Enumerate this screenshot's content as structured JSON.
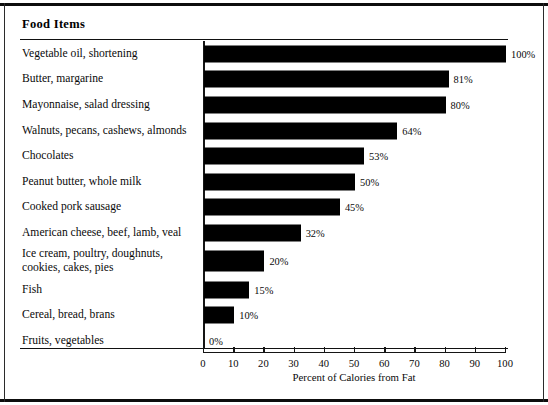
{
  "header": {
    "column_title": "Food  Items"
  },
  "chart_data": {
    "type": "bar",
    "orientation": "horizontal",
    "title": "",
    "xlabel": "Percent of Calories from Fat",
    "ylabel": "Food  Items",
    "xlim": [
      0,
      100
    ],
    "xticks": [
      0,
      10,
      20,
      30,
      40,
      50,
      60,
      70,
      80,
      90,
      100
    ],
    "xtick_labels": [
      "0",
      "10",
      "20",
      "30",
      "40",
      "50",
      "60",
      "70",
      "80",
      "90",
      "100"
    ],
    "grid": false,
    "legend": false,
    "bar_color": "#000000",
    "categories": [
      "Vegetable oil, shortening",
      "Butter, margarine",
      "Mayonnaise, salad dressing",
      "Walnuts, pecans, cashews, almonds",
      "Chocolates",
      "Peanut butter, whole milk",
      "Cooked pork sausage",
      "American cheese, beef, lamb, veal",
      "Ice cream, poultry, doughnuts,\ncookies, cakes, pies",
      "Fish",
      "Cereal, bread, brans",
      "Fruits, vegetables"
    ],
    "values": [
      100,
      81,
      80,
      64,
      53,
      50,
      45,
      32,
      20,
      15,
      10,
      0
    ],
    "data_labels": [
      "100%",
      "81%",
      "80%",
      "64%",
      "53%",
      "50%",
      "45%",
      "32%",
      "20%",
      "15%",
      "10%",
      "0%"
    ]
  },
  "rows": [
    {
      "label": "Vegetable oil, shortening",
      "value": 100,
      "value_label": "100%",
      "tall": false
    },
    {
      "label": "Butter, margarine",
      "value": 81,
      "value_label": "81%",
      "tall": false
    },
    {
      "label": "Mayonnaise, salad dressing",
      "value": 80,
      "value_label": "80%",
      "tall": false
    },
    {
      "label": "Walnuts, pecans, cashews, almonds",
      "value": 64,
      "value_label": "64%",
      "tall": false
    },
    {
      "label": "Chocolates",
      "value": 53,
      "value_label": "53%",
      "tall": false
    },
    {
      "label": "Peanut butter, whole milk",
      "value": 50,
      "value_label": "50%",
      "tall": false
    },
    {
      "label": "Cooked pork sausage",
      "value": 45,
      "value_label": "45%",
      "tall": false
    },
    {
      "label": "American cheese, beef, lamb, veal",
      "value": 32,
      "value_label": "32%",
      "tall": false
    },
    {
      "label": "Ice cream, poultry, doughnuts,\ncookies, cakes, pies",
      "value": 20,
      "value_label": "20%",
      "tall": true
    },
    {
      "label": "Fish",
      "value": 15,
      "value_label": "15%",
      "tall": false
    },
    {
      "label": "Cereal, bread, brans",
      "value": 10,
      "value_label": "10%",
      "tall": false
    },
    {
      "label": "Fruits, vegetables",
      "value": 0,
      "value_label": "0%",
      "tall": false
    }
  ],
  "axis": {
    "title": "Percent of Calories from Fat",
    "ticks": [
      "0",
      "10",
      "20",
      "30",
      "40",
      "50",
      "60",
      "70",
      "80",
      "90",
      "100"
    ]
  }
}
